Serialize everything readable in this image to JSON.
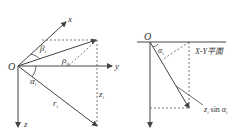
{
  "left_diagram": {
    "origin": "O",
    "axis_x": "x",
    "axis_y": "y",
    "axis_z": "z",
    "angle_beta": "β",
    "angle_beta_sub": "i",
    "angle_alpha": "α",
    "angle_alpha_sub": "i",
    "rho": "ρ",
    "rho_sub": "ij",
    "r": "r",
    "r_sub": "i",
    "z": "z",
    "z_sub": "i"
  },
  "right_diagram": {
    "origin": "O",
    "angle_alpha": "α",
    "angle_alpha_sub": "i",
    "plane_label": "X-Y平面",
    "projection_label": "z",
    "projection_sub": "i",
    "projection_func": " sin ",
    "projection_alpha": "α",
    "projection_alpha_sub": "i"
  },
  "colors": {
    "line": "#444444",
    "text": "#333333"
  }
}
